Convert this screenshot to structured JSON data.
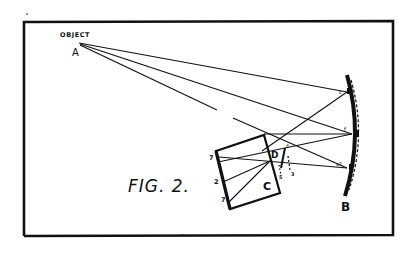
{
  "figure": {
    "caption": "FIG. 2.",
    "object_label": "OBJECT",
    "point_labels": {
      "object_point": "A",
      "mirror": "B",
      "box": "C",
      "lens": "D"
    },
    "mirror_marks": [
      "c",
      "f",
      "c1"
    ],
    "box_side_marks": [
      "7",
      "2",
      "7"
    ],
    "lens_marks": [
      "4",
      "5",
      "3"
    ],
    "colors": {
      "ink": "#111111",
      "paper": "#ffffff"
    }
  }
}
